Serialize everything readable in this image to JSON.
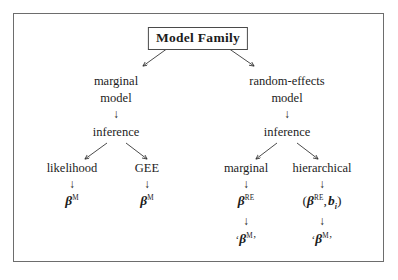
{
  "figure": {
    "type": "tree-diagram",
    "background_color": "#ffffff",
    "frame_color": "#6d6d6d",
    "text_color": "#1c1c1c",
    "root": {
      "label": "Model Family",
      "boxed": true,
      "box_border_color": "#4a4a4a"
    },
    "branches": {
      "left": {
        "level1_line1": "marginal",
        "level1_line2": "model",
        "level2": "inference",
        "children": [
          {
            "label": "likelihood",
            "result_beta": "β",
            "result_sup": "M"
          },
          {
            "label": "GEE",
            "result_beta": "β",
            "result_sup": "M"
          }
        ]
      },
      "right": {
        "level1_line1": "random-effects",
        "level1_line2": "model",
        "level2": "inference",
        "children": [
          {
            "label": "marginal",
            "result_beta": "β",
            "result_sup": "RE",
            "final_open_quote": "‘",
            "final_beta": "β",
            "final_sup": "M",
            "final_close_quote": "’"
          },
          {
            "label": "hierarchical",
            "open_paren": "(",
            "result_beta": "β",
            "result_sup": "RE",
            "comma": ",",
            "b_var": "b",
            "b_sub": "i",
            "close_paren": ")",
            "final_open_quote": "‘",
            "final_beta": "β",
            "final_sup": "M",
            "final_close_quote": "’"
          }
        ]
      }
    },
    "arrow_glyph_down": "↓"
  }
}
